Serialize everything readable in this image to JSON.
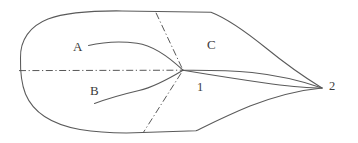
{
  "figure": {
    "kind": "line-drawing",
    "background_color": "#ffffff",
    "stroke_color": "#5a5a5a",
    "axis_color": "#4e4e4e",
    "text_color": "#3b3b3b",
    "width": 358,
    "height": 143
  },
  "labels": {
    "vein_a": "A",
    "vein_b": "B",
    "region_c": "C",
    "node_1": "1",
    "node_2": "2"
  },
  "geometry": {
    "outline_upper": "M 20.5 58 C 20.0 40.0 30.0 26.0 48.0 19.0 C 66.0 12.2 92.0 10.6 122.0 10.9 L 211.0 12.2 C 226.0 18.0 245.0 31.0 266.0 48.0 C 288.0 66.0 309.0 80.0 322.0 88.0",
    "outline_lower": "M 20.5 58 C 20.2 72.0 21.5 84.0 25.5 94.0 C 33.0 112.0 52.0 124.5 80.0 129.5 C 100.0 132.8 122.0 133.4 142.5 132.6 L 196.0 130.8 C 210.0 124.0 228.0 115.0 250.0 106.0 C 280.0 94.5 306.0 89.5 322.0 88.0",
    "outline_notch": "M 142.5 132.6 L 196.0 130.8",
    "vein_central": "M 183.0 70.2 C 205.0 70.0 232.0 70.5 252.0 72.5 C 280.0 75.5 305.0 82.0 322.0 88.0",
    "vein_lower_margin": "M 183.0 70.2 C 212.0 75.0 244.0 80.0 272.0 84.0 C 296.0 87.0 312.0 88.0 322.0 88.0",
    "vein_a_path": "M 88.5 45.5 C 104.0 41.8 122.0 41.2 137.0 43.2 C 152.0 45.3 168.0 56.0 183.0 70.2",
    "vein_b_path": "M 94.5 103.5 C 108.0 98.5 124.0 94.0 139.0 90.5 C 155.0 86.8 170.0 78.0 183.0 70.2",
    "axis_horizontal": "M 19.0 70.6 L 183.0 70.2",
    "axis_diagonal": "M 156.0 12.8 L 183.0 70.2 L 143.5 132.2"
  }
}
